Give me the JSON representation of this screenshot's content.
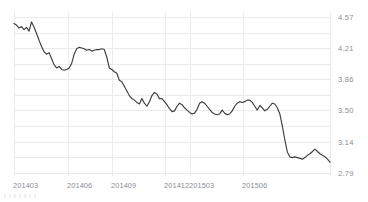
{
  "chart_data": {
    "type": "line",
    "title": "",
    "subtitle": "",
    "xlabel": "",
    "ylabel": "",
    "grid": true,
    "legend": false,
    "legend_position": "none",
    "line_color": "#3d3d42",
    "grid_color": "#e9ecef",
    "tick_label_color": "#8a8f96",
    "ylim": [
      2.61,
      4.75
    ],
    "ytick_labels": [
      "4.57",
      "4.21",
      "3.86",
      "3.50",
      "3.14",
      "2.79"
    ],
    "ytick_values": [
      4.57,
      4.21,
      3.86,
      3.5,
      3.14,
      2.79
    ],
    "xtick_labels": [
      "201403",
      "201406",
      "201409",
      "201412",
      "201503",
      "201506"
    ],
    "xtick_values": [
      201403,
      201406,
      201409,
      201412,
      201503,
      201506
    ],
    "xtick_positions_pct": [
      0.0,
      17.1,
      31.0,
      47.8,
      55.7,
      72.5
    ],
    "x": [
      0,
      1,
      2,
      3,
      4,
      5,
      6,
      7,
      8,
      9,
      10,
      11,
      12,
      13,
      14,
      15,
      16,
      17,
      18,
      19,
      20,
      21,
      22,
      23,
      24,
      25,
      26,
      27,
      28,
      29,
      30,
      31,
      32,
      33,
      34,
      35,
      36,
      37,
      38,
      39,
      40,
      41,
      42,
      43,
      44,
      45,
      46,
      47,
      48,
      49,
      50,
      51,
      52,
      53,
      54,
      55,
      56,
      57,
      58,
      59,
      60,
      61,
      62,
      63,
      64,
      65,
      66,
      67,
      68,
      69,
      70,
      71,
      72,
      73,
      74,
      75,
      76,
      77,
      78,
      79,
      80,
      81,
      82,
      83,
      84,
      85,
      86,
      87,
      88,
      89,
      90,
      91,
      92,
      93,
      94,
      95,
      96,
      97,
      98,
      99,
      100,
      101,
      102,
      103,
      104,
      105,
      106,
      107,
      108,
      109,
      110,
      111,
      112,
      113,
      114,
      115,
      116,
      117,
      118,
      119,
      120,
      121,
      122,
      123,
      124,
      125,
      126
    ],
    "values": [
      4.6,
      4.58,
      4.54,
      4.56,
      4.52,
      4.55,
      4.5,
      4.62,
      4.55,
      4.47,
      4.38,
      4.3,
      4.23,
      4.2,
      4.22,
      4.14,
      4.06,
      4.02,
      4.04,
      4.0,
      3.99,
      4.0,
      4.02,
      4.08,
      4.2,
      4.27,
      4.29,
      4.28,
      4.27,
      4.25,
      4.26,
      4.24,
      4.25,
      4.26,
      4.26,
      4.27,
      4.26,
      4.16,
      4.02,
      4.0,
      3.97,
      3.95,
      3.86,
      3.84,
      3.78,
      3.72,
      3.66,
      3.62,
      3.6,
      3.57,
      3.55,
      3.62,
      3.56,
      3.52,
      3.58,
      3.66,
      3.7,
      3.68,
      3.62,
      3.62,
      3.58,
      3.54,
      3.49,
      3.45,
      3.46,
      3.52,
      3.56,
      3.54,
      3.5,
      3.47,
      3.44,
      3.42,
      3.43,
      3.48,
      3.56,
      3.58,
      3.56,
      3.52,
      3.48,
      3.44,
      3.42,
      3.41,
      3.42,
      3.47,
      3.43,
      3.41,
      3.42,
      3.46,
      3.52,
      3.56,
      3.58,
      3.57,
      3.58,
      3.6,
      3.6,
      3.57,
      3.52,
      3.47,
      3.53,
      3.5,
      3.46,
      3.48,
      3.52,
      3.56,
      3.55,
      3.5,
      3.42,
      3.26,
      3.08,
      2.92,
      2.86,
      2.85,
      2.86,
      2.85,
      2.84,
      2.83,
      2.85,
      2.88,
      2.9,
      2.93,
      2.96,
      2.93,
      2.9,
      2.88,
      2.86,
      2.83,
      2.79
    ]
  },
  "axes": {
    "y_ticks": [
      {
        "label": "4.57",
        "pos_pct": 3.0
      },
      {
        "label": "4.21",
        "pos_pct": 22.0
      },
      {
        "label": "3.86",
        "pos_pct": 41.0
      },
      {
        "label": "3.50",
        "pos_pct": 60.0
      },
      {
        "label": "3.14",
        "pos_pct": 79.0
      },
      {
        "label": "2.79",
        "pos_pct": 98.0
      }
    ],
    "x_ticks": [
      {
        "label": "201403",
        "left_px": 13
      },
      {
        "label": "201406",
        "left_px": 67
      },
      {
        "label": "201409",
        "left_px": 111
      },
      {
        "label": "201412",
        "left_px": 164
      },
      {
        "label": "201503",
        "left_px": 189
      },
      {
        "label": "201506",
        "left_px": 242
      }
    ],
    "h_gridline_pcts": [
      3.0,
      12.5,
      22.0,
      31.5,
      41.0,
      50.5,
      60.0,
      69.5,
      79.0,
      88.5,
      98.0
    ],
    "v_gridline_pcts": [
      0.0,
      17.1,
      31.0,
      47.8,
      55.7,
      72.5,
      100.0
    ]
  }
}
